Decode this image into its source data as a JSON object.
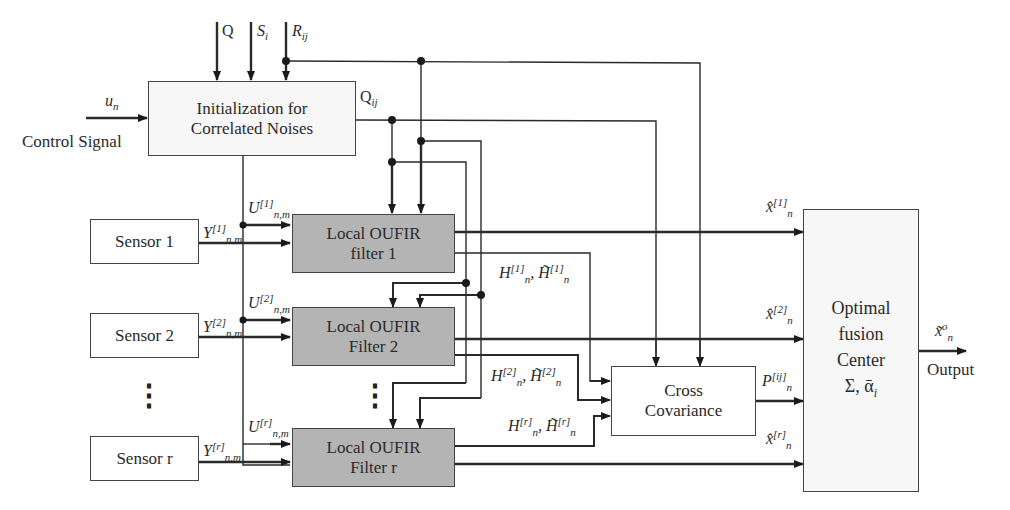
{
  "diagram": {
    "inputs": {
      "top": [
        {
          "symbol": "Q",
          "sub": ""
        },
        {
          "symbol": "S",
          "sub": "i"
        },
        {
          "symbol": "R",
          "sub": "ij"
        }
      ],
      "control": {
        "symbol": "u",
        "sub": "n",
        "label": "Control Signal"
      }
    },
    "init_block": {
      "line1": "Initialization for",
      "line2": "Correlated Noises",
      "output_symbol": "Q",
      "output_sub": "ij"
    },
    "sensors": [
      {
        "label": "Sensor 1"
      },
      {
        "label": "Sensor 2"
      },
      {
        "label": "Sensor r"
      }
    ],
    "filters": [
      {
        "line1": "Local OUFIR",
        "line2": "filter 1"
      },
      {
        "line1": "Local OUFIR",
        "line2": "Filter 2"
      },
      {
        "line1": "Local OUFIR",
        "line2": "Filter r"
      }
    ],
    "signals": {
      "Y": [
        {
          "symbol": "Y",
          "sup": "[1]",
          "sub": "n,m"
        },
        {
          "symbol": "Y",
          "sup": "[2]",
          "sub": "n,m"
        },
        {
          "symbol": "Y",
          "sup": "[r]",
          "sub": "n,m"
        }
      ],
      "U": [
        {
          "symbol": "U",
          "sup": "[1]",
          "sub": "n,m"
        },
        {
          "symbol": "U",
          "sup": "[2]",
          "sub": "n,m"
        },
        {
          "symbol": "U",
          "sup": "[r]",
          "sub": "n,m"
        }
      ],
      "H": [
        {
          "text": "H",
          "sup": "[1]",
          "sub": "n",
          "text2": ", H̃",
          "sup2": "[1]",
          "sub2": "n"
        },
        {
          "text": "H",
          "sup": "[2]",
          "sub": "n",
          "text2": ", H̃",
          "sup2": "[2]",
          "sub2": "n"
        },
        {
          "text": "H",
          "sup": "[r]",
          "sub": "n",
          "text2": ", H̃",
          "sup2": "[r]",
          "sub2": "n"
        }
      ],
      "xhat": [
        {
          "symbol": "x̂",
          "sup": "[1]",
          "sub": "n"
        },
        {
          "symbol": "x̂",
          "sup": "[2]",
          "sub": "n"
        },
        {
          "symbol": "x̂",
          "sup": "[r]",
          "sub": "n"
        }
      ],
      "P": {
        "symbol": "P",
        "sup": "[ij]",
        "sub": "n"
      }
    },
    "cross_cov": {
      "line1": "Cross",
      "line2": "Covariance"
    },
    "fusion": {
      "line1": "Optimal",
      "line2": "fusion",
      "line3": "Center",
      "line4": "Σ, ᾱ",
      "line4_sub": "i"
    },
    "output": {
      "symbol": "x̃",
      "sup": "o",
      "sub": "n",
      "label": "Output"
    },
    "ellipsis": "⋮"
  }
}
